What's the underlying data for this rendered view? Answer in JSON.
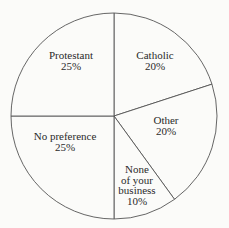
{
  "chart_data": {
    "type": "pie",
    "title": "",
    "start_angle_deg": -90,
    "direction": "clockwise",
    "categories": [
      "Catholic",
      "Other",
      "None of your business",
      "No preference",
      "Protestant"
    ],
    "values": [
      20,
      20,
      10,
      25,
      25
    ],
    "unit": "%",
    "slices": [
      {
        "label_lines": [
          "Catholic"
        ],
        "value_text": "20%",
        "value": 20
      },
      {
        "label_lines": [
          "Other"
        ],
        "value_text": "20%",
        "value": 20
      },
      {
        "label_lines": [
          "None",
          "of your",
          "business"
        ],
        "value_text": "10%",
        "value": 10
      },
      {
        "label_lines": [
          "No preference"
        ],
        "value_text": "25%",
        "value": 25
      },
      {
        "label_lines": [
          "Protestant"
        ],
        "value_text": "25%",
        "value": 25
      }
    ],
    "legend": "none",
    "colors": {
      "fill": "#fbfbf9",
      "stroke": "#555555",
      "text": "#2a2a2a"
    }
  },
  "labels": {
    "catholic": {
      "line1": "Catholic",
      "pct": "20%"
    },
    "other": {
      "line1": "Other",
      "pct": "20%"
    },
    "none": {
      "line1": "None",
      "line2": "of your",
      "line3": "business",
      "pct": "10%"
    },
    "no_preference": {
      "line1": "No preference",
      "pct": "25%"
    },
    "protestant": {
      "line1": "Protestant",
      "pct": "25%"
    }
  }
}
